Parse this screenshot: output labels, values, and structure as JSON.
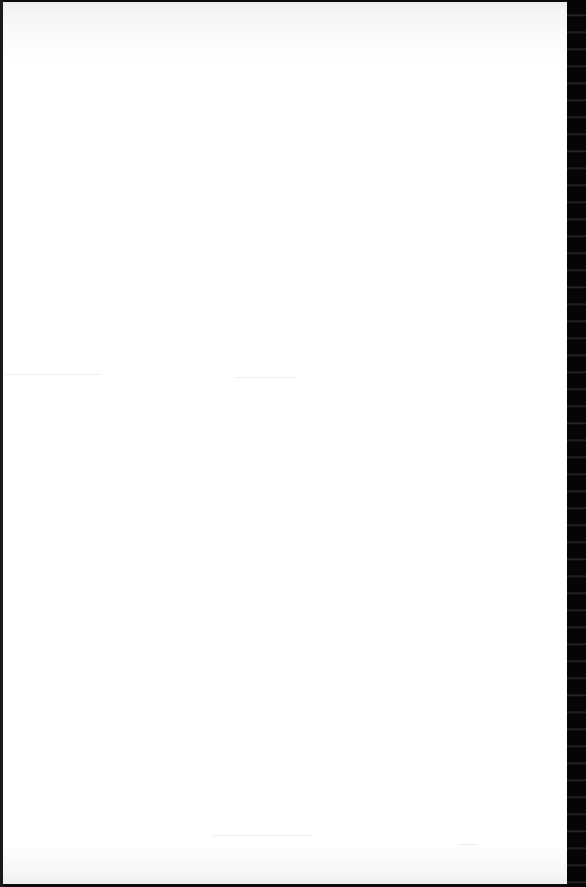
{
  "document": {
    "type": "scanned-page",
    "page_color": "#ffffff",
    "border_color": "#0c0c0c",
    "content": ""
  }
}
